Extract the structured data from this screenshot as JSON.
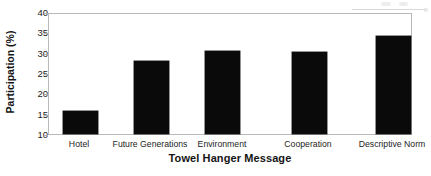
{
  "chart_data": {
    "type": "bar",
    "title": "",
    "xlabel": "Towel Hanger Message",
    "ylabel": "Participation (%)",
    "categories": [
      "Hotel",
      "Future Generations",
      "Environment",
      "Cooperation",
      "Descriptive Norm"
    ],
    "values": [
      15.7,
      28.2,
      30.7,
      30.5,
      34.4
    ],
    "ylim": [
      10,
      40
    ],
    "yticks": [
      10,
      15,
      20,
      25,
      30,
      35,
      40
    ],
    "ytick_labels": [
      "10",
      "15",
      "20",
      "25",
      "30",
      "35",
      "40"
    ],
    "grid": false,
    "legend": false,
    "bar_color": "#0a0a0a",
    "plot_border_color": "#b9b9b9",
    "background_color": "#ffffff"
  },
  "axes": {
    "y_title": "Participation (%)",
    "x_title": "Towel Hanger Message"
  }
}
